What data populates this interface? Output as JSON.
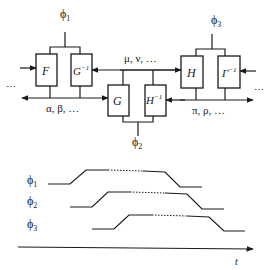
{
  "diagram": {
    "phases": {
      "phi1": {
        "label": "ϕ",
        "sub": "1"
      },
      "phi2": {
        "label": "ϕ",
        "sub": "2"
      },
      "phi3": {
        "label": "ϕ",
        "sub": "3"
      }
    },
    "blocks": {
      "F": {
        "label": "F",
        "sup": ""
      },
      "G_inv": {
        "label": "G",
        "sup": "−1"
      },
      "G": {
        "label": "G",
        "sup": ""
      },
      "H_inv": {
        "label": "H",
        "sup": "−1"
      },
      "H": {
        "label": "H",
        "sup": ""
      },
      "Gamma_inv": {
        "label": "Γ",
        "sup": "−1"
      }
    },
    "buses": {
      "alpha_beta": "α, β, …",
      "mu_nu": "μ, ν, …",
      "pi_rho": "π, ρ, …"
    },
    "ellipsis_left": "…",
    "ellipsis_right": "…"
  },
  "timing": {
    "axis_label": "t",
    "signals": [
      {
        "name": "ϕ",
        "sub": "1"
      },
      {
        "name": "ϕ",
        "sub": "2"
      },
      {
        "name": "ϕ",
        "sub": "3"
      }
    ]
  },
  "colors": {
    "ink": "#1a1a1a",
    "background": "#ffffff"
  }
}
